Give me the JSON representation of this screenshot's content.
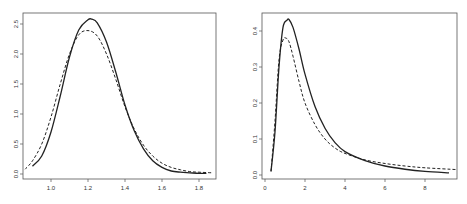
{
  "chart_data": [
    {
      "type": "line",
      "title": "",
      "xlabel": "",
      "ylabel": "",
      "xlim": [
        0.86,
        1.87
      ],
      "ylim": [
        0.0,
        2.6
      ],
      "grid": false,
      "legend": null,
      "xticks": [
        "1.0",
        "1.2",
        "1.4",
        "1.6",
        "1.8"
      ],
      "yticks": [
        "0.0",
        "0.5",
        "1.0",
        "1.5",
        "2.0",
        "2.5"
      ],
      "series": [
        {
          "name": "solid",
          "style": "solid",
          "x": [
            0.9,
            0.95,
            1.0,
            1.05,
            1.1,
            1.15,
            1.2,
            1.22,
            1.25,
            1.3,
            1.35,
            1.4,
            1.45,
            1.5,
            1.55,
            1.6,
            1.65,
            1.7,
            1.75,
            1.8,
            1.84
          ],
          "y": [
            0.13,
            0.3,
            0.7,
            1.3,
            1.95,
            2.4,
            2.57,
            2.58,
            2.52,
            2.2,
            1.7,
            1.15,
            0.72,
            0.42,
            0.22,
            0.11,
            0.05,
            0.03,
            0.02,
            0.01,
            0.01
          ]
        },
        {
          "name": "dashed",
          "style": "dashed",
          "x": [
            0.86,
            0.9,
            0.95,
            1.0,
            1.05,
            1.1,
            1.15,
            1.2,
            1.25,
            1.3,
            1.35,
            1.4,
            1.45,
            1.5,
            1.55,
            1.6,
            1.65,
            1.7,
            1.75,
            1.8,
            1.87
          ],
          "y": [
            0.08,
            0.22,
            0.5,
            0.95,
            1.5,
            2.0,
            2.32,
            2.39,
            2.3,
            2.0,
            1.58,
            1.12,
            0.75,
            0.48,
            0.3,
            0.18,
            0.11,
            0.07,
            0.04,
            0.03,
            0.02
          ]
        }
      ]
    },
    {
      "type": "line",
      "title": "",
      "xlabel": "",
      "ylabel": "",
      "xlim": [
        -0.3,
        9.6
      ],
      "ylim": [
        0.0,
        0.44
      ],
      "grid": false,
      "legend": null,
      "xticks": [
        "0",
        "2",
        "4",
        "6",
        "8"
      ],
      "yticks": [
        "0.0",
        "0.1",
        "0.2",
        "0.3",
        "0.4"
      ],
      "series": [
        {
          "name": "solid",
          "style": "solid",
          "x": [
            0.3,
            0.5,
            0.7,
            0.9,
            1.1,
            1.2,
            1.4,
            1.7,
            2.0,
            2.5,
            3.0,
            3.5,
            4.0,
            5.0,
            6.0,
            7.0,
            8.0,
            9.2
          ],
          "y": [
            0.01,
            0.12,
            0.3,
            0.41,
            0.43,
            0.432,
            0.41,
            0.35,
            0.28,
            0.19,
            0.13,
            0.09,
            0.065,
            0.04,
            0.025,
            0.016,
            0.01,
            0.006
          ]
        },
        {
          "name": "dashed",
          "style": "dashed",
          "x": [
            0.3,
            0.5,
            0.7,
            0.9,
            1.05,
            1.2,
            1.4,
            1.7,
            2.0,
            2.5,
            3.0,
            3.5,
            4.0,
            5.0,
            6.0,
            7.0,
            8.0,
            9.6
          ],
          "y": [
            0.01,
            0.15,
            0.32,
            0.375,
            0.38,
            0.37,
            0.33,
            0.26,
            0.2,
            0.14,
            0.1,
            0.075,
            0.06,
            0.042,
            0.032,
            0.025,
            0.02,
            0.015
          ]
        }
      ]
    }
  ]
}
